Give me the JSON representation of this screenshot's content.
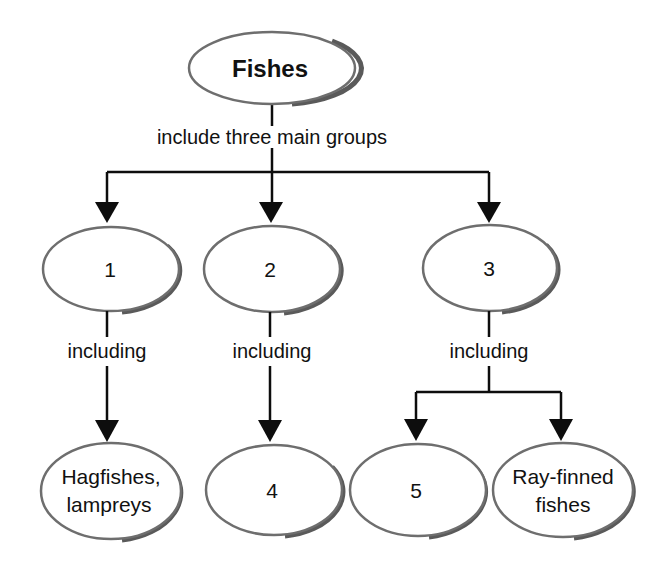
{
  "diagram": {
    "title": "Fishes",
    "root_link_label": "include three main groups",
    "groups": [
      {
        "label": "1",
        "link_label": "including",
        "children": [
          "Hagfishes, lampreys"
        ]
      },
      {
        "label": "2",
        "link_label": "including",
        "children": [
          "4"
        ]
      },
      {
        "label": "3",
        "link_label": "including",
        "children": [
          "5",
          "Ray-finned fishes"
        ]
      }
    ],
    "leaves": {
      "hagfishes_line1": "Hagfishes,",
      "hagfishes_line2": "lampreys",
      "leaf4": "4",
      "leaf5": "5",
      "rayfinned_line1": "Ray-finned",
      "rayfinned_line2": "fishes"
    },
    "colors": {
      "ellipse_border": "#6e6e6e",
      "shadow": "#5a5a5a",
      "lines": "#0d0d0d",
      "background": "#ffffff"
    }
  }
}
